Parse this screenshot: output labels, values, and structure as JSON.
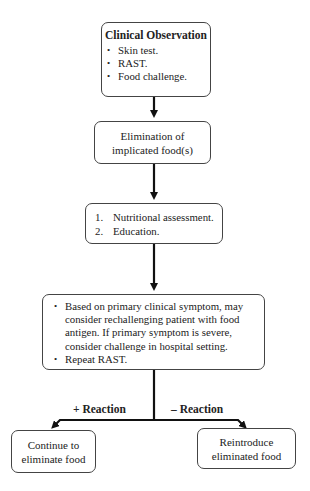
{
  "flowchart": {
    "box1": {
      "title": "Clinical Observation",
      "items": [
        "Skin test.",
        "RAST.",
        "Food challenge."
      ]
    },
    "box2": {
      "lines": [
        "Elimination of",
        "implicated food(s)"
      ]
    },
    "box3": {
      "items": [
        {
          "num": "1.",
          "text": "Nutritional assessment."
        },
        {
          "num": "2.",
          "text": "Education."
        }
      ]
    },
    "box4": {
      "items": [
        "Based on primary clinical symptom, may consider rechallenging patient with food antigen. If primary symptom is severe, consider challenge in hospital setting.",
        "Repeat RAST."
      ]
    },
    "branches": {
      "positive_label": "+ Reaction",
      "negative_label": "– Reaction"
    },
    "box5": {
      "lines": [
        "Continue to",
        "eliminate food"
      ]
    },
    "box6": {
      "lines": [
        "Reintroduce",
        "eliminated food"
      ]
    }
  }
}
